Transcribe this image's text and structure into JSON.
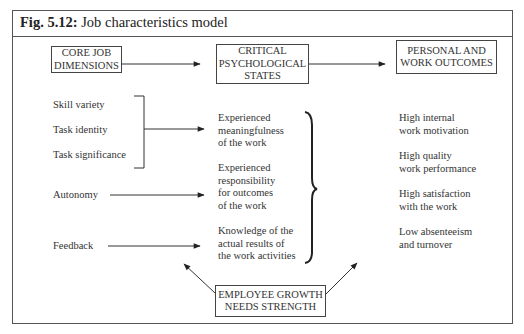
{
  "figure": {
    "number": "Fig. 5.12:",
    "title": "Job characteristics model"
  },
  "headers": {
    "core": [
      "CORE JOB",
      "DIMENSIONS"
    ],
    "critical": [
      "CRITICAL",
      "PSYCHOLOGICAL",
      "STATES"
    ],
    "outcomes": [
      "PERSONAL AND",
      "WORK OUTCOMES"
    ]
  },
  "core_dimensions": [
    "Skill variety",
    "Task identity",
    "Task significance",
    "Autonomy",
    "Feedback"
  ],
  "psychological_states": [
    [
      "Experienced",
      "meaningfulness",
      "of the work"
    ],
    [
      "Experienced",
      "responsibility",
      "for outcomes",
      "of the work"
    ],
    [
      "Knowledge of the",
      "actual results of",
      "the work activities"
    ]
  ],
  "outcomes": [
    [
      "High internal",
      "work motivation"
    ],
    [
      "High quality",
      "work performance"
    ],
    [
      "High satisfaction",
      "with the work"
    ],
    [
      "Low absenteeism",
      "and turnover"
    ]
  ],
  "moderator": [
    "EMPLOYEE GROWTH",
    "NEEDS STRENGTH"
  ],
  "colors": {
    "line": "#333333",
    "frame": "#555555",
    "text": "#2a2a2a"
  }
}
